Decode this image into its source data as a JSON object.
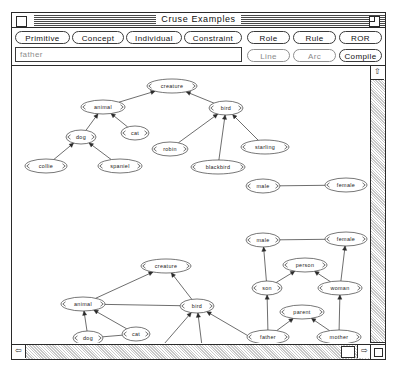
{
  "window": {
    "title": "Cruse Examples",
    "close_box": "close-box",
    "zoom_box": "zoom-box"
  },
  "toolbar": {
    "buttons_row1": [
      {
        "id": "primitive",
        "label": "Primitive",
        "enabled": true
      },
      {
        "id": "concept",
        "label": "Concept",
        "enabled": true
      },
      {
        "id": "individual",
        "label": "Individual",
        "enabled": true
      },
      {
        "id": "constraint",
        "label": "Constraint",
        "enabled": true
      },
      {
        "id": "role",
        "label": "Role",
        "enabled": true
      },
      {
        "id": "rule",
        "label": "Rule",
        "enabled": true
      },
      {
        "id": "ror",
        "label": "ROR",
        "enabled": true
      }
    ],
    "buttons_row2": [
      {
        "id": "line",
        "label": "Line",
        "enabled": false
      },
      {
        "id": "arc",
        "label": "Arc",
        "enabled": false
      },
      {
        "id": "compile",
        "label": "Compile",
        "enabled": true
      }
    ],
    "name_field": {
      "value": "father",
      "placeholder": "father"
    }
  },
  "scrollbars": {
    "vertical": {
      "up_arrow": "⇧"
    },
    "horizontal": {
      "left_arrow": "⇦",
      "right_arrow": "⇨"
    }
  },
  "graph": {
    "upper": {
      "nodes": [
        {
          "id": "creature",
          "label": "creature",
          "x": 160,
          "y": 20,
          "rx": 25,
          "ry": 7
        },
        {
          "id": "animal",
          "label": "animal",
          "x": 91,
          "y": 41,
          "rx": 22,
          "ry": 7
        },
        {
          "id": "bird",
          "label": "bird",
          "x": 214,
          "y": 42,
          "rx": 17,
          "ry": 7
        },
        {
          "id": "dog",
          "label": "dog",
          "x": 69,
          "y": 71,
          "rx": 15,
          "ry": 7
        },
        {
          "id": "cat",
          "label": "cat",
          "x": 123,
          "y": 67,
          "rx": 14,
          "ry": 7
        },
        {
          "id": "collie",
          "label": "collie",
          "x": 34,
          "y": 100,
          "rx": 21,
          "ry": 7
        },
        {
          "id": "spaniel",
          "label": "spaniel",
          "x": 108,
          "y": 100,
          "rx": 22,
          "ry": 7
        },
        {
          "id": "robin",
          "label": "robin",
          "x": 158,
          "y": 83,
          "rx": 18,
          "ry": 7
        },
        {
          "id": "starling",
          "label": "starling",
          "x": 253,
          "y": 81,
          "rx": 24,
          "ry": 7
        },
        {
          "id": "blackbird",
          "label": "blackbird",
          "x": 206,
          "y": 101,
          "rx": 27,
          "ry": 7
        },
        {
          "id": "male",
          "label": "male",
          "x": 251,
          "y": 120,
          "rx": 17,
          "ry": 7
        },
        {
          "id": "female",
          "label": "female",
          "x": 334,
          "y": 119,
          "rx": 21,
          "ry": 7
        }
      ],
      "edges": [
        {
          "from": "animal",
          "to": "creature",
          "arrow": true
        },
        {
          "from": "bird",
          "to": "creature",
          "arrow": true
        },
        {
          "from": "dog",
          "to": "animal",
          "arrow": true
        },
        {
          "from": "cat",
          "to": "animal",
          "arrow": true
        },
        {
          "from": "collie",
          "to": "dog",
          "arrow": true
        },
        {
          "from": "spaniel",
          "to": "dog",
          "arrow": true
        },
        {
          "from": "robin",
          "to": "bird",
          "arrow": true
        },
        {
          "from": "blackbird",
          "to": "bird",
          "arrow": true
        },
        {
          "from": "starling",
          "to": "bird",
          "arrow": true
        },
        {
          "from": "male",
          "to": "female",
          "arrow": false
        }
      ]
    },
    "lower": {
      "nodes": [
        {
          "id": "creature2",
          "label": "creature",
          "x": 154,
          "y": 200,
          "rx": 25,
          "ry": 7
        },
        {
          "id": "animal2",
          "label": "animal",
          "x": 71,
          "y": 238,
          "rx": 22,
          "ry": 7
        },
        {
          "id": "bird2",
          "label": "bird",
          "x": 185,
          "y": 240,
          "rx": 17,
          "ry": 7
        },
        {
          "id": "dog2",
          "label": "dog",
          "x": 76,
          "y": 272,
          "rx": 15,
          "ry": 7
        },
        {
          "id": "cat2",
          "label": "cat",
          "x": 124,
          "y": 268,
          "rx": 14,
          "ry": 7
        },
        {
          "id": "collie2",
          "label": "collie",
          "x": 33,
          "y": 304,
          "rx": 21,
          "ry": 7
        },
        {
          "id": "spaniel2",
          "label": "spaniel",
          "x": 106,
          "y": 303,
          "rx": 22,
          "ry": 7
        },
        {
          "id": "robin2",
          "label": "robin",
          "x": 146,
          "y": 285,
          "rx": 18,
          "ry": 7
        },
        {
          "id": "starling2",
          "label": "starling",
          "x": 262,
          "y": 285,
          "rx": 24,
          "ry": 7
        },
        {
          "id": "blackbird2",
          "label": "blackbird",
          "x": 193,
          "y": 304,
          "rx": 27,
          "ry": 7
        },
        {
          "id": "male2",
          "label": "male",
          "x": 251,
          "y": 174,
          "rx": 17,
          "ry": 7
        },
        {
          "id": "female2",
          "label": "female",
          "x": 334,
          "y": 173,
          "rx": 21,
          "ry": 7
        },
        {
          "id": "person",
          "label": "person",
          "x": 293,
          "y": 199,
          "rx": 22,
          "ry": 7
        },
        {
          "id": "son",
          "label": "son",
          "x": 255,
          "y": 222,
          "rx": 15,
          "ry": 7
        },
        {
          "id": "woman",
          "label": "woman",
          "x": 328,
          "y": 222,
          "rx": 22,
          "ry": 7
        },
        {
          "id": "parent",
          "label": "parent",
          "x": 290,
          "y": 246,
          "rx": 22,
          "ry": 7
        },
        {
          "id": "father",
          "label": "father",
          "x": 256,
          "y": 271,
          "rx": 21,
          "ry": 7
        },
        {
          "id": "mother",
          "label": "mother",
          "x": 327,
          "y": 271,
          "rx": 22,
          "ry": 7
        }
      ],
      "edges": [
        {
          "from": "animal2",
          "to": "creature2",
          "arrow": true
        },
        {
          "from": "bird2",
          "to": "creature2",
          "arrow": true
        },
        {
          "from": "dog2",
          "to": "animal2",
          "arrow": true
        },
        {
          "from": "cat2",
          "to": "animal2",
          "arrow": true
        },
        {
          "from": "collie2",
          "to": "dog2",
          "arrow": true
        },
        {
          "from": "spaniel2",
          "to": "dog2",
          "arrow": true
        },
        {
          "from": "robin2",
          "to": "bird2",
          "arrow": true
        },
        {
          "from": "blackbird2",
          "to": "bird2",
          "arrow": true
        },
        {
          "from": "starling2",
          "to": "bird2",
          "arrow": true
        },
        {
          "from": "animal2",
          "to": "bird2",
          "arrow": false
        },
        {
          "from": "dog2",
          "to": "cat2",
          "arrow": false
        },
        {
          "from": "collie2",
          "to": "spaniel2",
          "arrow": false
        },
        {
          "from": "robin2",
          "to": "starling2",
          "arrow": false
        },
        {
          "from": "male2",
          "to": "female2",
          "arrow": false
        },
        {
          "from": "son",
          "to": "male2",
          "arrow": true
        },
        {
          "from": "son",
          "to": "person",
          "arrow": true
        },
        {
          "from": "woman",
          "to": "person",
          "arrow": true
        },
        {
          "from": "woman",
          "to": "female2",
          "arrow": true
        },
        {
          "from": "father",
          "to": "son",
          "arrow": true
        },
        {
          "from": "father",
          "to": "parent",
          "arrow": true
        },
        {
          "from": "mother",
          "to": "parent",
          "arrow": true
        },
        {
          "from": "mother",
          "to": "woman",
          "arrow": true
        }
      ],
      "individuals": [
        {
          "id": "charles",
          "label": "Charles",
          "x": 106,
          "y": 333,
          "w": 40,
          "h": 12,
          "instance_of": "spaniel2"
        },
        {
          "id": "tweetie",
          "label": "Tweetie",
          "x": 193,
          "y": 333,
          "w": 40,
          "h": 12,
          "instance_of": "blackbird2"
        }
      ]
    }
  }
}
